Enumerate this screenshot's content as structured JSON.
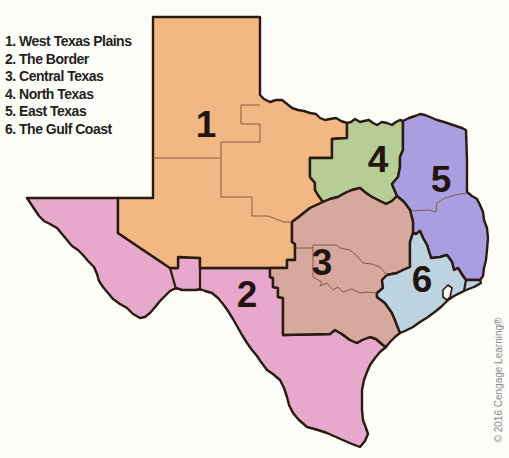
{
  "legend": {
    "items": [
      {
        "label": "1. West Texas Plains"
      },
      {
        "label": "2. The Border"
      },
      {
        "label": "3. Central Texas"
      },
      {
        "label": "4. North Texas"
      },
      {
        "label": "5. East Texas"
      },
      {
        "label": "6. The Gulf Coast"
      }
    ]
  },
  "map": {
    "title": "Texas regions",
    "border_color": "#2b1a12",
    "label_color": "#231410",
    "background_color": "#fdfdfa",
    "regions": [
      {
        "number": "1",
        "name": "West Texas Plains",
        "color": "#f2b883"
      },
      {
        "number": "2",
        "name": "The Border",
        "color": "#e6a9cc"
      },
      {
        "number": "3",
        "name": "Central Texas",
        "color": "#d7a89e"
      },
      {
        "number": "4",
        "name": "North Texas",
        "color": "#b8cc95"
      },
      {
        "number": "5",
        "name": "East Texas",
        "color": "#a99ee0"
      },
      {
        "number": "6",
        "name": "The Gulf Coast",
        "color": "#bdd3df"
      }
    ]
  },
  "copyright": "© 2016 Cengage Learning®"
}
